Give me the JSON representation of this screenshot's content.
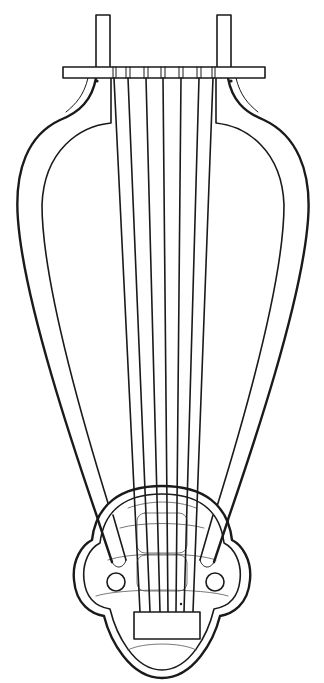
{
  "figure": {
    "colors": {
      "background": "#ffffff",
      "ink": "#1a1a1a"
    },
    "parts": {
      "pegs": 2,
      "crossbar": "yoke",
      "strings": 7,
      "arms": 2,
      "soundbox": "trefoil body",
      "sound_holes": 2,
      "bridge": "rectangular tailpiece"
    }
  }
}
